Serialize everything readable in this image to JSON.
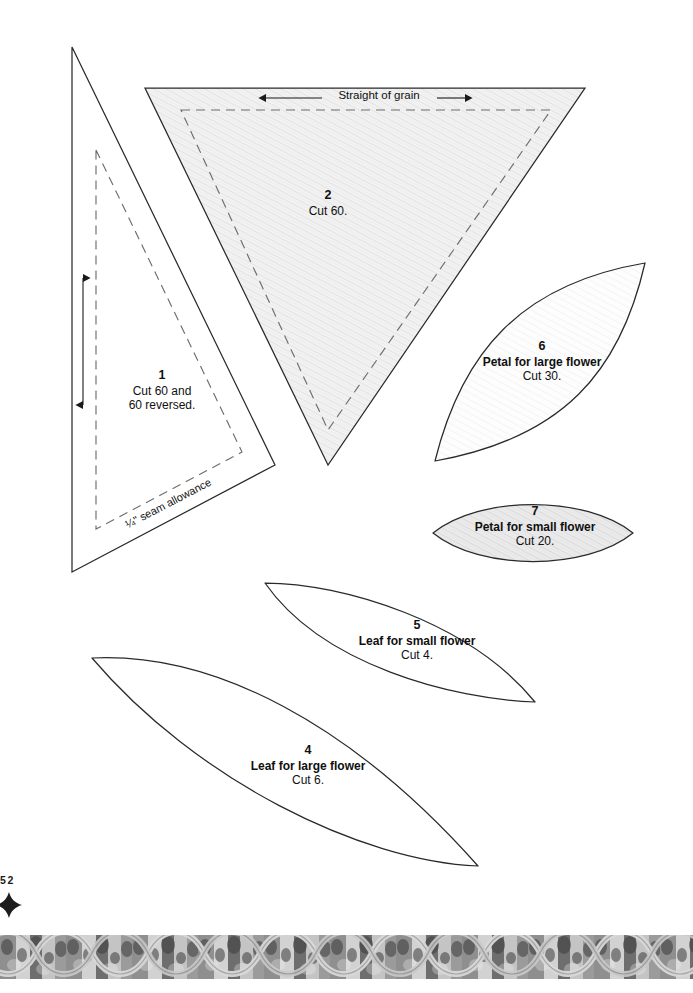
{
  "page": {
    "folio_number": "52",
    "ornament_icon": "diamond-ornament-icon",
    "width": 693,
    "height": 993,
    "background_color": "#ffffff",
    "ink_color": "#1a1a1a"
  },
  "annotations": {
    "grain_label": "Straight of grain",
    "seam_allowance_note": "¼\" seam allowance"
  },
  "pieces": [
    {
      "id": "piece-1",
      "number": "1",
      "description": "",
      "cut_line_1": "Cut 60 and",
      "cut_line_2": "60 reversed.",
      "shape": "right-triangle",
      "fill": "#ffffff",
      "has_grain_arrow": true,
      "grain_arrow_direction": "vertical",
      "has_seam_line": true
    },
    {
      "id": "piece-2",
      "number": "2",
      "description": "",
      "cut_line_1": "Cut 60.",
      "cut_line_2": "",
      "shape": "inverted-triangle",
      "fill": "#f0f0f0",
      "has_grain_arrow": true,
      "grain_arrow_direction": "horizontal",
      "has_seam_line": true
    },
    {
      "id": "piece-4",
      "number": "4",
      "description": "Leaf for large flower",
      "cut_line_1": "Cut 6.",
      "cut_line_2": "",
      "shape": "leaf",
      "fill": "#ffffff",
      "has_grain_arrow": false,
      "has_seam_line": false
    },
    {
      "id": "piece-5",
      "number": "5",
      "description": "Leaf for small flower",
      "cut_line_1": "Cut 4.",
      "cut_line_2": "",
      "shape": "leaf",
      "fill": "#ffffff",
      "has_grain_arrow": false,
      "has_seam_line": false
    },
    {
      "id": "piece-6",
      "number": "6",
      "description": "Petal for large flower",
      "cut_line_1": "Cut 30.",
      "cut_line_2": "",
      "shape": "pointed-oval",
      "fill": "#fbfbfb",
      "has_grain_arrow": false,
      "has_seam_line": false
    },
    {
      "id": "piece-7",
      "number": "7",
      "description": "Petal for small flower",
      "cut_line_1": "Cut 20.",
      "cut_line_2": "",
      "shape": "pointed-oval",
      "fill": "#ececec",
      "has_grain_arrow": false,
      "has_seam_line": false
    }
  ]
}
